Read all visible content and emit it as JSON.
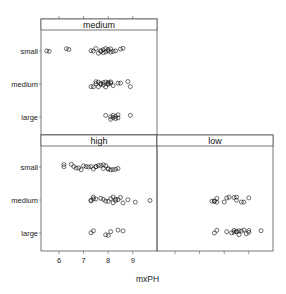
{
  "chart_data": {
    "type": "scatter",
    "subtype": "lattice stripplot (jittered)",
    "xlabel": "mxPH",
    "ylabel": "",
    "x_ticks": [
      6,
      7,
      8,
      9
    ],
    "xlim": [
      5.4,
      10.1
    ],
    "y_categories": [
      "small",
      "medium",
      "large"
    ],
    "layout": "2 columns x 2 rows (top-right empty)",
    "grid": false,
    "panels": [
      {
        "strip": "medium",
        "position": "top-left",
        "series": [
          {
            "category": "small",
            "values": [
              5.5,
              5.6,
              6.3,
              6.4,
              7.3,
              7.4,
              7.5,
              7.6,
              7.7,
              7.7,
              7.8,
              7.8,
              7.9,
              7.9,
              8.0,
              8.0,
              8.1,
              8.1,
              8.2,
              8.3,
              8.5,
              8.6
            ]
          },
          {
            "category": "medium",
            "values": [
              7.3,
              7.4,
              7.5,
              7.5,
              7.6,
              7.6,
              7.7,
              7.7,
              7.8,
              7.8,
              7.9,
              7.9,
              8.0,
              8.0,
              8.0,
              8.1,
              8.1,
              8.2,
              8.4,
              8.5,
              8.8,
              8.9
            ]
          },
          {
            "category": "large",
            "values": [
              7.9,
              8.1,
              8.1,
              8.2,
              8.2,
              8.3,
              8.3,
              8.4,
              8.4,
              8.9
            ]
          }
        ]
      },
      {
        "strip": "high",
        "position": "bottom-left",
        "series": [
          {
            "category": "small",
            "values": [
              6.2,
              6.2,
              6.5,
              6.6,
              6.7,
              6.8,
              6.9,
              7.0,
              7.1,
              7.2,
              7.3,
              7.4,
              7.5,
              7.5,
              7.6,
              7.7,
              7.8,
              7.8,
              7.9,
              8.0,
              8.0,
              8.1,
              8.2,
              8.3,
              8.4
            ]
          },
          {
            "category": "medium",
            "values": [
              7.3,
              7.3,
              7.4,
              7.4,
              7.5,
              7.7,
              7.8,
              7.9,
              8.0,
              8.1,
              8.2,
              8.2,
              8.3,
              8.3,
              8.4,
              8.5,
              8.6,
              8.8,
              9.1,
              9.7
            ]
          },
          {
            "category": "large",
            "values": [
              7.3,
              7.4,
              7.9,
              8.0,
              8.1,
              8.4,
              8.6
            ]
          }
        ]
      },
      {
        "strip": "low",
        "position": "bottom-right",
        "series": [
          {
            "category": "small",
            "values": []
          },
          {
            "category": "medium",
            "values": [
              7.5,
              7.6,
              7.6,
              7.7,
              7.7,
              8.0,
              8.1,
              8.2,
              8.4,
              8.5,
              8.5,
              8.7,
              8.8,
              9.0
            ]
          },
          {
            "category": "large",
            "values": [
              7.6,
              7.7,
              8.1,
              8.3,
              8.4,
              8.4,
              8.5,
              8.5,
              8.6,
              8.6,
              8.7,
              8.8,
              8.9,
              9.0,
              9.0,
              9.5
            ]
          }
        ]
      }
    ]
  },
  "labels": {
    "xlabel": "mxPH",
    "strips": {
      "medium": "medium",
      "high": "high",
      "low": "low"
    },
    "rows": [
      "small",
      "medium",
      "large"
    ],
    "ticks": [
      "6",
      "7",
      "8",
      "9"
    ]
  },
  "colors": {
    "frame": "#555555",
    "strip_bg": "#ffffff",
    "point": "#111111"
  }
}
